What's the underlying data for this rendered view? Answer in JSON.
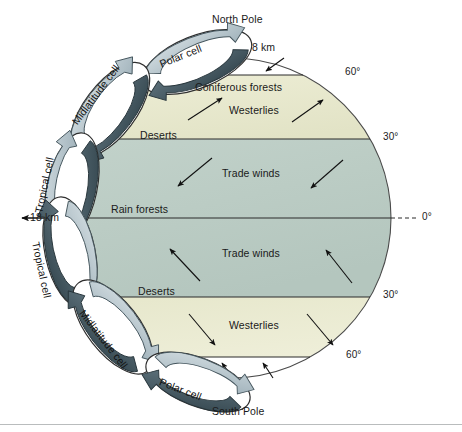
{
  "figure": {
    "type": "diagram",
    "width": 462,
    "height": 432
  },
  "poles": {
    "north": "North Pole",
    "south": "South Pole"
  },
  "heights": {
    "polar_tropopause": "8 km",
    "equatorial_tropopause": "18 km"
  },
  "latitudes": {
    "north_60": "60°",
    "north_30": "30°",
    "equator": "0°",
    "south_30": "30°",
    "south_60": "60°"
  },
  "cells": [
    {
      "id": "polar-cell-north",
      "label": "Polar cell"
    },
    {
      "id": "midlatitude-cell-north",
      "label": "Midlatitude cell"
    },
    {
      "id": "tropical-cell-north",
      "label": "Tropical cell"
    },
    {
      "id": "tropical-cell-south",
      "label": "Tropical cell"
    },
    {
      "id": "midlatitude-cell-south",
      "label": "Midlatitude cell"
    },
    {
      "id": "polar-cell-south",
      "label": "Polar cell"
    }
  ],
  "bands": {
    "north_coniferous": "Coniferous forests",
    "north_westerlies": "Westerlies",
    "north_deserts": "Deserts",
    "north_trade_winds": "Trade winds",
    "equator_rain_forests": "Rain forests",
    "south_trade_winds": "Trade winds",
    "south_deserts": "Deserts",
    "south_westerlies": "Westerlies"
  },
  "colors": {
    "temperate_band": "#e9e9cf",
    "tropical_band": "#bccdc5",
    "polar_band": "#ffffff",
    "outline": "#3a3a3a",
    "cell_fill": "#ffffff",
    "cell_arrow_light": "#b9c6cc",
    "cell_arrow_dark": "#4d6068",
    "text": "#1a1a1a",
    "background": "#ffffff"
  }
}
